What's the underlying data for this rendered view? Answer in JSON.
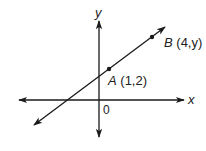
{
  "diagram": {
    "axes": {
      "x_label": "x",
      "y_label": "y",
      "origin_label": "0"
    },
    "points": [
      {
        "id": "A",
        "name": "A",
        "coords": "(1,2)"
      },
      {
        "id": "B",
        "name": "B",
        "coords": "(4,y)"
      }
    ],
    "colors": {
      "stroke": "#1a1a1a",
      "background": "#ffffff"
    }
  }
}
